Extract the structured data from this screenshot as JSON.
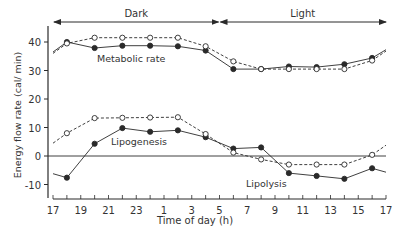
{
  "chart_data": {
    "type": "line",
    "title": "",
    "xlabel": "Time of day (h)",
    "ylabel": "Energy flow rate (cal/ min)",
    "x_ticks": [
      "17",
      "19",
      "21",
      "23",
      "1",
      "3",
      "5",
      "7",
      "9",
      "11",
      "13",
      "15",
      "17"
    ],
    "y_ticks": [
      40,
      30,
      20,
      10,
      0,
      -10
    ],
    "ylim": [
      -14,
      46
    ],
    "xlim_hours_from_17": [
      0,
      24
    ],
    "grid": false,
    "zero_line": true,
    "periods": [
      {
        "label": "Dark",
        "start": "17",
        "end": "5"
      },
      {
        "label": "Light",
        "start": "5",
        "end": "17"
      }
    ],
    "annotations": [
      "Metabolic rate",
      "Lipogenesis",
      "Lipolysis"
    ],
    "x": [
      18,
      20,
      22,
      24,
      26,
      28,
      30,
      32,
      34,
      36,
      38,
      40
    ],
    "x_labels": [
      "18",
      "20",
      "22",
      "24",
      "2",
      "4",
      "6",
      "8",
      "10",
      "12",
      "14",
      "16"
    ],
    "series": [
      {
        "name": "Metabolic rate (filled)",
        "marker": "filled-circle",
        "line": "solid",
        "values": [
          40.0,
          37.9,
          38.7,
          38.7,
          38.5,
          37.0,
          30.5,
          30.5,
          31.4,
          31.2,
          32.2,
          34.4
        ]
      },
      {
        "name": "Metabolic rate (open)",
        "marker": "open-circle",
        "line": "dashed",
        "values": [
          39.5,
          41.5,
          41.5,
          41.5,
          41.5,
          38.5,
          33.2,
          30.5,
          30.5,
          30.5,
          30.5,
          33.5
        ]
      },
      {
        "name": "Lipogenesis/Lipolysis (filled)",
        "marker": "filled-circle",
        "line": "solid",
        "values": [
          -7.6,
          4.3,
          9.8,
          8.5,
          9.0,
          6.6,
          2.6,
          3.0,
          -6.0,
          -7.0,
          -8.0,
          -4.3
        ]
      },
      {
        "name": "Lipogenesis/Lipolysis (open)",
        "marker": "open-circle",
        "line": "dashed",
        "values": [
          8.0,
          13.3,
          13.4,
          13.5,
          13.6,
          7.7,
          1.2,
          -1.2,
          -3.0,
          -3.0,
          -3.0,
          0.4
        ]
      }
    ],
    "tails": {
      "metabolic_filled": {
        "start": 36.5,
        "end": 37.3
      },
      "metabolic_open": {
        "start": 36.0,
        "end": 36.8
      },
      "lipid_filled": {
        "start": -6.2,
        "end": -5.7
      },
      "lipid_open": {
        "start": 4.5,
        "end": 3.8
      }
    }
  }
}
